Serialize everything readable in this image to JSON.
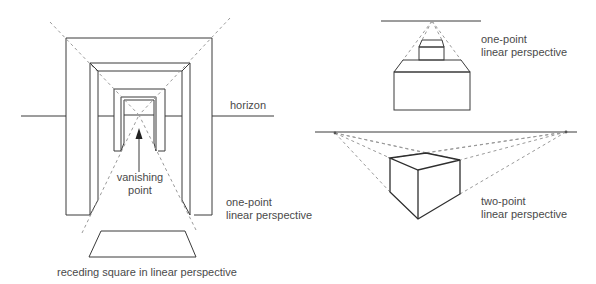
{
  "labels": {
    "horizon": "horizon",
    "vanishing_point_line1": "vanishing",
    "vanishing_point_line2": "point",
    "left_caption_line1": "one-point",
    "left_caption_line2": "linear perspective",
    "receding_square": "receding square in linear perspective",
    "top_right_caption_line1": "one-point",
    "top_right_caption_line2": "linear perspective",
    "bottom_right_caption_line1": "two-point",
    "bottom_right_caption_line2": "linear perspective"
  },
  "colors": {
    "line": "#3a3a3a",
    "dashed_construction": "#9a9a9a",
    "text": "#4a4a4a",
    "background": "#ffffff"
  }
}
